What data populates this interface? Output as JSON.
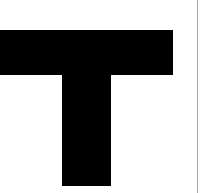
{
  "image": {
    "kind": "scanned-glyph",
    "width": 193,
    "height": 193,
    "background_color": "#ffffff"
  },
  "glyph": {
    "character": "T",
    "name": "letter-t",
    "color": "#000000",
    "style": "sans-serif-bold-slab",
    "crossbar": {
      "x": 0,
      "y": 30,
      "width": 173,
      "height": 45
    },
    "stem": {
      "x": 62,
      "y": 74,
      "width": 49,
      "height": 112
    }
  },
  "divider": {
    "name": "vertical-rule",
    "color": "#a8a8a8",
    "x": 197,
    "width": 1
  }
}
